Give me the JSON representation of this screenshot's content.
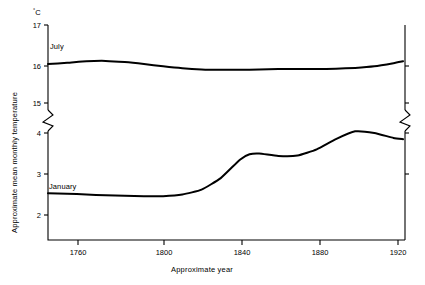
{
  "chart_data": {
    "type": "line",
    "title": "",
    "subtitle": "",
    "xlabel": "Approximate year",
    "ylabel": "Approximate mean monthly temperature",
    "unit_label": "°C",
    "grid": false,
    "legend_position": "inline-annotation",
    "axis_break": {
      "present": true,
      "between": [
        5,
        14
      ],
      "style": "zigzag",
      "sides": [
        "left",
        "right"
      ]
    },
    "xlim": [
      1740,
      1926
    ],
    "xticks": [
      1760,
      1800,
      1840,
      1880,
      1920
    ],
    "xtick_labels": [
      "1760",
      "1800",
      "1840",
      "1880",
      "1920"
    ],
    "yticks_upper": [
      15,
      16,
      17
    ],
    "ytick_labels_upper": [
      "15",
      "16",
      "17"
    ],
    "yticks_lower": [
      2,
      3,
      4
    ],
    "ytick_labels_lower": [
      "2",
      "3",
      "4"
    ],
    "ylim_upper": [
      14.85,
      17.0
    ],
    "ylim_lower": [
      1.55,
      4.2
    ],
    "series": [
      {
        "name": "July",
        "label": "July",
        "panel": "upper",
        "x": [
          1740,
          1750,
          1760,
          1770,
          1780,
          1790,
          1800,
          1810,
          1820,
          1830,
          1840,
          1850,
          1860,
          1870,
          1880,
          1890,
          1900,
          1910,
          1920,
          1925
        ],
        "values": [
          16.0,
          16.03,
          16.07,
          16.08,
          16.05,
          16.0,
          15.94,
          15.89,
          15.86,
          15.85,
          15.85,
          15.86,
          15.87,
          15.87,
          15.87,
          15.88,
          15.9,
          15.94,
          16.02,
          16.07
        ]
      },
      {
        "name": "January",
        "label": "January",
        "panel": "lower",
        "x": [
          1740,
          1750,
          1760,
          1770,
          1780,
          1790,
          1800,
          1810,
          1820,
          1830,
          1840,
          1845,
          1850,
          1860,
          1870,
          1880,
          1890,
          1900,
          1910,
          1920,
          1925
        ],
        "values": [
          2.53,
          2.52,
          2.5,
          2.48,
          2.47,
          2.46,
          2.46,
          2.5,
          2.62,
          2.9,
          3.35,
          3.48,
          3.5,
          3.44,
          3.45,
          3.6,
          3.85,
          4.04,
          4.0,
          3.88,
          3.85
        ]
      }
    ]
  }
}
